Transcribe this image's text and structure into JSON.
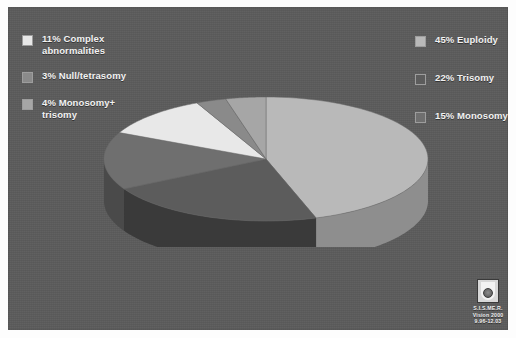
{
  "panel": {
    "background": "#5b5b5b"
  },
  "legend_left": {
    "items": [
      {
        "label": "11% Complex\nabnormalities",
        "color": "#e8e8e8",
        "indent": false
      },
      {
        "label": "3% Null/tetrasomy",
        "color": "#8a8a8a",
        "indent": false
      },
      {
        "label": "4% Monosomy+\ntrisomy",
        "color": "#a6a6a6",
        "indent": true
      }
    ]
  },
  "legend_right": {
    "items": [
      {
        "label": "45% Euploidy",
        "color": "#b9b9b9",
        "indent": false
      },
      {
        "label": "22% Trisomy",
        "color": "#5c5c5c",
        "indent": false
      },
      {
        "label": "15% Monosomy",
        "color": "#6f6f6f",
        "indent": false
      }
    ]
  },
  "logo": {
    "line1": "S.I.S.ME.R.",
    "line2": "Vision 2000",
    "line3": "9.96-12.03"
  },
  "chart_data": {
    "type": "pie",
    "title": "",
    "three_d": true,
    "legend_position": "left and right",
    "unit": "%",
    "labels": [
      "45% Euploidy",
      "22% Trisomy",
      "15% Monosomy",
      "11% Complex abnormalities",
      "3% Null/tetrasomy",
      "4% Monosomy+ trisomy"
    ],
    "categories": [
      "Euploidy",
      "Trisomy",
      "Monosomy",
      "Complex abnormalities",
      "Null/tetrasomy",
      "Monosomy+ trisomy"
    ],
    "values": [
      45,
      22,
      15,
      11,
      3,
      4
    ],
    "colors": [
      "#b9b9b9",
      "#5c5c5c",
      "#6f6f6f",
      "#e8e8e8",
      "#8a8a8a",
      "#a6a6a6"
    ],
    "side_colors": [
      "#8e8e8e",
      "#3a3a3a",
      "#4a4a4a",
      "#b4b4b4",
      "#6a6a6a",
      "#7f7f7f"
    ],
    "start_angle_deg": -90,
    "direction": "clockwise",
    "total": 100
  }
}
